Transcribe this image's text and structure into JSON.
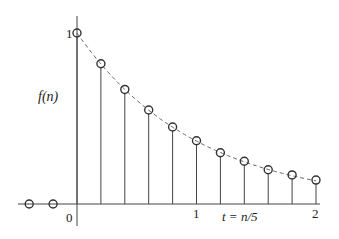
{
  "chart_data": {
    "type": "stem",
    "title": "",
    "xlabel": "t = n/5",
    "ylabel": "f(n)",
    "x_ticks": [
      {
        "n": 0,
        "label": "0"
      },
      {
        "n": 5,
        "label": "1"
      },
      {
        "n": 10,
        "label": "2"
      }
    ],
    "y_ticks": [
      {
        "value": 1,
        "label": "1"
      }
    ],
    "n": [
      -2,
      -1,
      0,
      1,
      2,
      3,
      4,
      5,
      6,
      7,
      8,
      9,
      10
    ],
    "values": [
      0,
      0,
      1.0,
      0.82,
      0.67,
      0.55,
      0.45,
      0.37,
      0.3,
      0.25,
      0.2,
      0.17,
      0.14
    ],
    "envelope": {
      "style": "dashed",
      "description": "continuous exponential decay e^(-t) through sample points for n >= 0"
    },
    "xlim": [
      -2.5,
      10.5
    ],
    "ylim": [
      0,
      1.1
    ],
    "grid": false,
    "legend": null
  },
  "labels": {
    "y_axis": "f(n)",
    "x_axis": "t = n/5",
    "origin": "0",
    "tick_1": "1",
    "tick_2": "2",
    "y_one": "1"
  }
}
